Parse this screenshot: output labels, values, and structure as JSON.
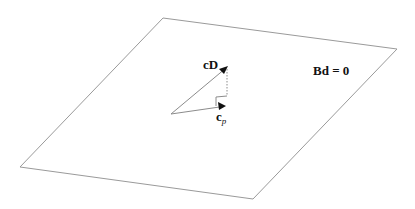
{
  "diagram": {
    "plane": {
      "corners": [
        [
          163,
          18
        ],
        [
          397,
          49
        ],
        [
          253,
          199
        ],
        [
          20,
          167
        ]
      ],
      "stroke": "#9a9a9a",
      "equation_label": "Bd = 0"
    },
    "origin": [
      171,
      114
    ],
    "vectors": [
      {
        "name": "cD",
        "label": "cD",
        "tip": [
          228,
          66
        ]
      },
      {
        "name": "c_p",
        "label_main": "c",
        "label_sub": "p",
        "tip": [
          226,
          106
        ]
      }
    ],
    "projection_line": {
      "from": [
        227,
        68
      ],
      "to": [
        227,
        96
      ],
      "style": "dotted"
    },
    "right_angle_marker": {
      "x": 216,
      "y": 96,
      "size": 11
    },
    "colors": {
      "plane": "#9a9a9a",
      "vector": "#8c8c8c",
      "arrowhead": "#111111",
      "text": "#111111"
    }
  }
}
